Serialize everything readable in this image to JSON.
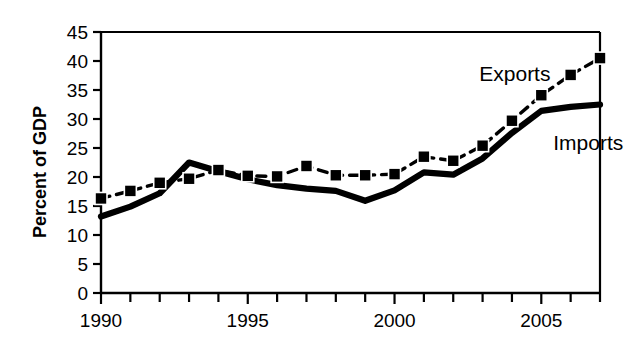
{
  "chart_data": {
    "type": "line",
    "title": "",
    "subtitle": "",
    "xlabel": "",
    "ylabel": "Percent of GDP",
    "x": [
      1990,
      1991,
      1992,
      1993,
      1994,
      1995,
      1996,
      1997,
      1998,
      1999,
      2000,
      2001,
      2002,
      2003,
      2004,
      2005,
      2006,
      2007
    ],
    "xlim": [
      1990,
      2007
    ],
    "ylim": [
      0,
      45
    ],
    "y_ticks": [
      0,
      5,
      10,
      15,
      20,
      25,
      30,
      35,
      40,
      45
    ],
    "y_tick_labels": [
      "0",
      "5",
      "10",
      "15",
      "20",
      "25",
      "30",
      "35",
      "40",
      "45"
    ],
    "x_ticks": [
      1990,
      1991,
      1992,
      1993,
      1994,
      1995,
      1996,
      1997,
      1998,
      1999,
      2000,
      2001,
      2002,
      2003,
      2004,
      2005,
      2006,
      2007
    ],
    "x_tick_labels_shown": [
      "1990",
      "1995",
      "2000",
      "2005"
    ],
    "x_labeled_years": [
      1990,
      1995,
      2000,
      2005
    ],
    "grid": false,
    "legend_position": "inline-annotation",
    "series": [
      {
        "name": "Exports",
        "style": "dashed",
        "marker": "square",
        "color": "#000000",
        "values": [
          16.3,
          17.6,
          19.0,
          19.7,
          21.2,
          20.2,
          20.1,
          21.9,
          20.3,
          20.3,
          20.5,
          23.5,
          22.8,
          25.4,
          29.7,
          34.1,
          37.6,
          40.5
        ]
      },
      {
        "name": "Imports",
        "style": "solid",
        "marker": "none",
        "color": "#000000",
        "values": [
          13.2,
          14.9,
          17.2,
          22.5,
          21.0,
          19.6,
          18.6,
          18.0,
          17.6,
          15.9,
          17.7,
          20.8,
          20.4,
          23.2,
          27.6,
          31.4,
          32.1,
          32.5
        ]
      }
    ],
    "annotations": [
      {
        "text": "Exports",
        "x": 2004.1,
        "y": 36.6
      },
      {
        "text": "Imports",
        "x": 2006.6,
        "y": 24.6
      }
    ]
  },
  "axis": {
    "y_title": "Percent of GDP"
  }
}
